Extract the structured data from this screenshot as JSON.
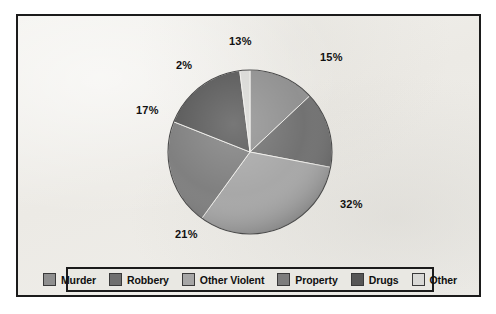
{
  "figure": {
    "background_color": "#efeeea",
    "frame_color": "#1b1b1b"
  },
  "chart_data": {
    "type": "pie",
    "title": "",
    "subtitle": "",
    "xlabel": "",
    "ylabel": "",
    "grid": false,
    "legend_position": "bottom",
    "start_angle_deg": 0,
    "direction": "clockwise",
    "units": "percent",
    "categories": [
      "Murder",
      "Robbery",
      "Other Violent",
      "Property",
      "Drugs",
      "Other"
    ],
    "values": [
      13,
      15,
      32,
      21,
      17,
      2
    ],
    "data_labels": [
      "13%",
      "15%",
      "32%",
      "21%",
      "17%",
      "2%"
    ],
    "colors": [
      "#8f8f8f",
      "#6f6f6f",
      "#a6a6a6",
      "#7d7d7d",
      "#565656",
      "#d9d9d6"
    ],
    "slices": [
      {
        "label": "Murder",
        "value": 13,
        "display": "13%",
        "color": "#8f8f8f"
      },
      {
        "label": "Robbery",
        "value": 15,
        "display": "15%",
        "color": "#6f6f6f"
      },
      {
        "label": "Other Violent",
        "value": 32,
        "display": "32%",
        "color": "#a6a6a6"
      },
      {
        "label": "Property",
        "value": 21,
        "display": "21%",
        "color": "#7d7d7d"
      },
      {
        "label": "Drugs",
        "value": 17,
        "display": "17%",
        "color": "#565656"
      },
      {
        "label": "Other",
        "value": 2,
        "display": "2%",
        "color": "#d9d9d6"
      }
    ]
  },
  "labels": {
    "murder_pct": "13%",
    "robbery_pct": "15%",
    "other_violent_pct": "32%",
    "property_pct": "21%",
    "drugs_pct": "17%",
    "other_pct": "2%"
  },
  "legend": {
    "items": [
      {
        "label": "Murder",
        "color": "#8f8f8f"
      },
      {
        "label": "Robbery",
        "color": "#6f6f6f"
      },
      {
        "label": "Other Violent",
        "color": "#a6a6a6"
      },
      {
        "label": "Property",
        "color": "#7d7d7d"
      },
      {
        "label": "Drugs",
        "color": "#565656"
      },
      {
        "label": "Other",
        "color": "#d9d9d6"
      }
    ]
  }
}
